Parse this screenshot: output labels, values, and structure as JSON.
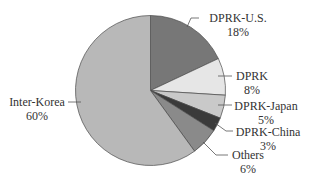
{
  "chart_data": {
    "type": "pie",
    "title": "",
    "start_angle_deg": 0,
    "direction": "clockwise",
    "categories": [
      "DPRK-U.S.",
      "DPRK",
      "DPRK-Japan",
      "DPRK-China",
      "Others",
      "Inter-Korea"
    ],
    "values": [
      18,
      8,
      5,
      3,
      6,
      60
    ],
    "value_labels": [
      "18%",
      "8%",
      "5%",
      "3%",
      "6%",
      "60%"
    ],
    "colors": [
      "#777777",
      "#e6e6e6",
      "#c9c9c9",
      "#3a3a3a",
      "#8a8a8a",
      "#b8b8b8"
    ],
    "legend": "none (leader-line labels)",
    "grid": false
  },
  "labels": {
    "dprk_us": {
      "name": "DPRK-U.S.",
      "pct": "18%"
    },
    "dprk": {
      "name": "DPRK",
      "pct": "8%"
    },
    "dprk_japan": {
      "name": "DPRK-Japan",
      "pct": "5%"
    },
    "dprk_china": {
      "name": "DPRK-China",
      "pct": "3%"
    },
    "others": {
      "name": "Others",
      "pct": "6%"
    },
    "inter_korea": {
      "name": "Inter-Korea",
      "pct": "60%"
    }
  }
}
